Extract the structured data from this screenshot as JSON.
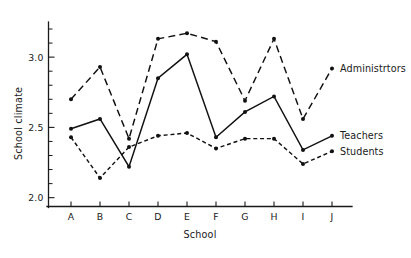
{
  "chart_data": {
    "type": "line",
    "title": "",
    "xlabel": "School",
    "ylabel": "School climate",
    "categories": [
      "A",
      "B",
      "C",
      "D",
      "E",
      "F",
      "G",
      "H",
      "I",
      "J"
    ],
    "x_tick_labels": [
      "A",
      "B",
      "C",
      "D",
      "E",
      "F",
      "G",
      "H",
      "I",
      "J"
    ],
    "y_tick_labels": [
      "2.0",
      "2.5",
      "3.0"
    ],
    "y_tick_values": [
      2.0,
      2.5,
      3.0
    ],
    "y_minor_tick_values": [
      2.1,
      2.2,
      2.3,
      2.4,
      2.6,
      2.7,
      2.8,
      2.9,
      3.1,
      3.2
    ],
    "ylim": [
      1.93,
      3.25
    ],
    "xlim": [
      0,
      11
    ],
    "grid": false,
    "legend_position": "right-inline",
    "series": [
      {
        "name": "Administrtors",
        "label": "Administrtors",
        "line_style": "long-dash",
        "marker": "filled-circle",
        "color": "#111111",
        "values": [
          2.7,
          2.93,
          2.42,
          3.13,
          3.17,
          3.11,
          2.69,
          3.13,
          2.56,
          2.92
        ]
      },
      {
        "name": "Teachers",
        "label": "Teachers",
        "line_style": "solid",
        "marker": "filled-circle",
        "color": "#111111",
        "values": [
          2.49,
          2.56,
          2.22,
          2.85,
          3.02,
          2.43,
          2.61,
          2.72,
          2.34,
          2.44
        ]
      },
      {
        "name": "Students",
        "label": "Students",
        "line_style": "short-dash",
        "marker": "filled-circle",
        "color": "#111111",
        "values": [
          2.43,
          2.14,
          2.36,
          2.44,
          2.46,
          2.35,
          2.42,
          2.42,
          2.24,
          2.33
        ]
      }
    ]
  }
}
